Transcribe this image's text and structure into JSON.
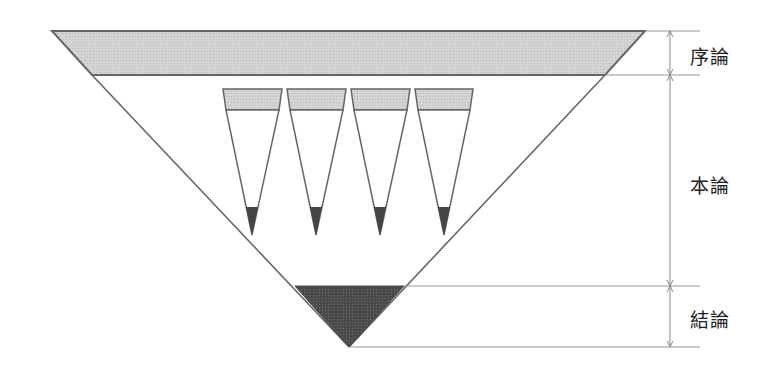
{
  "diagram": {
    "sections": [
      {
        "id": "intro",
        "label": "序論"
      },
      {
        "id": "body",
        "label": "本論"
      },
      {
        "id": "conclusion",
        "label": "結論"
      }
    ],
    "sub_arguments_count": 4,
    "colors": {
      "light_fill": "#d2d2d2",
      "dark_fill": "#4a4a4a",
      "stroke": "#6a6a6a",
      "dim_line": "#888888"
    }
  }
}
